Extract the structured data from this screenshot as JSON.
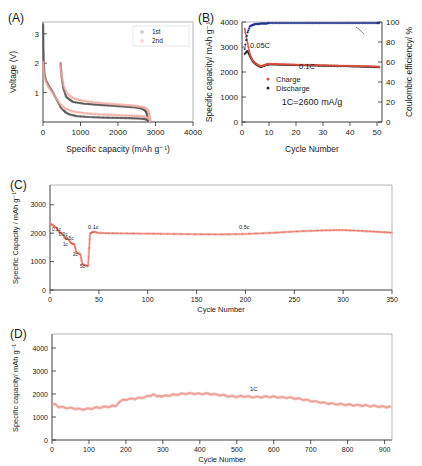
{
  "figure": {
    "panels": [
      "A",
      "B",
      "C",
      "D"
    ],
    "colors": {
      "charge_red": "#d94f3d",
      "discharge_black": "#2b2b2b",
      "efficiency_blue": "#23348c",
      "curve_pink": "#f0a9a0",
      "curve_gray": "#555555",
      "axis": "#2b2b2b"
    }
  },
  "panelA": {
    "label": "(A)",
    "xlabel": "Specific capacity (mAh g⁻¹)",
    "ylabel": "Voltage (V)",
    "xticks": [
      "0",
      "1000",
      "2000",
      "3000",
      "4000"
    ],
    "yticks": [
      "1",
      "2",
      "3"
    ],
    "legend": [
      "1st",
      "2nd"
    ]
  },
  "panelB": {
    "label": "(B)",
    "xlabel": "Cycle Number",
    "ylabel": "Specific capacity/ mAh g⁻¹",
    "ylabel_right": "Coulombic efficiency/ %",
    "xticks": [
      "0",
      "10",
      "20",
      "30",
      "40",
      "50"
    ],
    "yticks": [
      "0",
      "1000",
      "2000",
      "3000",
      "4000"
    ],
    "yticks_right": [
      "0",
      "20",
      "40",
      "60",
      "80",
      "100"
    ],
    "legend": [
      "Charge",
      "Discharge"
    ],
    "annotations": [
      "0.05C",
      "0.1C",
      "1C=2600 mA/g"
    ]
  },
  "panelC": {
    "label": "(C)",
    "xlabel": "Cycle Number",
    "ylabel": "Specific Capacity / mAh g⁻¹",
    "xticks": [
      "0",
      "50",
      "100",
      "150",
      "200",
      "250",
      "300",
      "350"
    ],
    "yticks": [
      "0",
      "1000",
      "2000",
      "3000"
    ],
    "rate_labels": [
      "0.1c",
      "0.2c",
      "0.5c",
      "1c",
      "2c",
      "5c",
      "0.1c",
      "0.5c"
    ]
  },
  "panelD": {
    "label": "(D)",
    "xlabel": "Cycle Number",
    "ylabel": "Specific capacity/ mAh g⁻¹",
    "xticks": [
      "0",
      "100",
      "200",
      "300",
      "400",
      "500",
      "600",
      "700",
      "800",
      "900"
    ],
    "yticks": [
      "0",
      "1000",
      "2000",
      "3000",
      "4000"
    ],
    "annotations": [
      "1C"
    ]
  },
  "chart_data": [
    {
      "type": "line",
      "panel": "A",
      "title": "Galvanostatic charge-discharge voltage profiles",
      "xlabel": "Specific capacity (mAh g-1)",
      "ylabel": "Voltage (V)",
      "xlim": [
        0,
        4000
      ],
      "ylim": [
        0,
        3.4
      ],
      "grid": false,
      "legend": [
        "1st",
        "2nd"
      ],
      "legend_position": "top-right",
      "series": [
        {
          "name": "1st discharge",
          "color": "#555555",
          "x": [
            5,
            10,
            20,
            40,
            80,
            150,
            260,
            380,
            470,
            520,
            560,
            600,
            700,
            900,
            1200,
            1600,
            2000,
            2300,
            2500,
            2650,
            2720,
            2760,
            2790,
            2800
          ],
          "y": [
            3.3,
            2.6,
            2.1,
            1.62,
            1.42,
            1.25,
            1.02,
            0.72,
            0.5,
            0.42,
            0.38,
            0.33,
            0.26,
            0.2,
            0.17,
            0.15,
            0.14,
            0.13,
            0.12,
            0.11,
            0.1,
            0.09,
            0.07,
            0.05
          ]
        },
        {
          "name": "1st charge",
          "color": "#555555",
          "x": [
            2800,
            2780,
            2750,
            2700,
            2600,
            2450,
            2200,
            1900,
            1500,
            1100,
            800,
            620,
            540,
            500,
            480,
            470
          ],
          "y": [
            0.05,
            0.22,
            0.35,
            0.42,
            0.47,
            0.5,
            0.52,
            0.55,
            0.58,
            0.62,
            0.68,
            0.85,
            1.15,
            1.5,
            1.8,
            2.0
          ]
        },
        {
          "name": "2nd discharge",
          "color": "#f0a9a0",
          "x": [
            5,
            12,
            25,
            50,
            100,
            180,
            300,
            450,
            600,
            800,
            1100,
            1500,
            1900,
            2200,
            2450,
            2620,
            2720,
            2790,
            2830,
            2860
          ],
          "y": [
            2.05,
            1.85,
            1.62,
            1.45,
            1.3,
            1.12,
            0.9,
            0.62,
            0.45,
            0.36,
            0.3,
            0.26,
            0.24,
            0.22,
            0.21,
            0.2,
            0.18,
            0.14,
            0.1,
            0.05
          ]
        },
        {
          "name": "2nd charge",
          "color": "#f0a9a0",
          "x": [
            2860,
            2840,
            2810,
            2760,
            2680,
            2550,
            2350,
            2050,
            1700,
            1350,
            1050,
            820,
            660,
            560,
            500,
            470,
            455
          ],
          "y": [
            0.05,
            0.25,
            0.38,
            0.45,
            0.5,
            0.53,
            0.56,
            0.59,
            0.63,
            0.67,
            0.72,
            0.8,
            0.95,
            1.2,
            1.55,
            1.85,
            2.0
          ]
        }
      ]
    },
    {
      "type": "scatter",
      "panel": "B",
      "title": "Cycling performance at 0.05C then 0.1C",
      "xlabel": "Cycle Number",
      "ylabel": "Specific capacity/ mAh g-1",
      "ylabel_right": "Coulombic efficiency/ %",
      "xlim": [
        0,
        52
      ],
      "ylim": [
        0,
        4000
      ],
      "ylim_right": [
        0,
        100
      ],
      "grid": false,
      "legend": [
        "Charge",
        "Discharge"
      ],
      "annotations": [
        {
          "text": "0.05C",
          "x": 4,
          "y": 3250
        },
        {
          "text": "0.1C",
          "x": 24,
          "y": 2620
        },
        {
          "text": "1C=2600 mA/g",
          "x": 26,
          "y": 1200
        }
      ],
      "series": [
        {
          "name": "Discharge",
          "color": "#2b2b2b",
          "axis": "left",
          "x": [
            1,
            2,
            3,
            4,
            5,
            6,
            7,
            8,
            9,
            10,
            12,
            14,
            16,
            18,
            20,
            22,
            24,
            26,
            28,
            30,
            32,
            34,
            36,
            38,
            40,
            42,
            44,
            46,
            48,
            50,
            51
          ],
          "y": [
            2720,
            2850,
            2620,
            2420,
            2320,
            2250,
            2200,
            2240,
            2280,
            2300,
            2300,
            2290,
            2285,
            2280,
            2275,
            2270,
            2265,
            2260,
            2255,
            2250,
            2245,
            2240,
            2235,
            2230,
            2225,
            2220,
            2215,
            2210,
            2205,
            2195,
            2190
          ]
        },
        {
          "name": "Charge",
          "color": "#d94f3d",
          "axis": "left",
          "x": [
            1,
            2,
            3,
            4,
            5,
            6,
            7,
            8,
            9,
            10,
            12,
            14,
            16,
            18,
            20,
            22,
            24,
            26,
            28,
            30,
            32,
            34,
            36,
            38,
            40,
            42,
            44,
            46,
            48,
            50,
            51
          ],
          "y": [
            3720,
            3200,
            2680,
            2460,
            2350,
            2280,
            2230,
            2265,
            2305,
            2325,
            2320,
            2310,
            2305,
            2300,
            2295,
            2290,
            2285,
            2280,
            2275,
            2270,
            2265,
            2260,
            2255,
            2250,
            2245,
            2240,
            2235,
            2230,
            2225,
            2215,
            2210
          ]
        },
        {
          "name": "Coulombic efficiency",
          "color": "#23348c",
          "axis": "right",
          "x": [
            1,
            2,
            3,
            4,
            5,
            6,
            7,
            8,
            9,
            10,
            12,
            14,
            16,
            18,
            20,
            22,
            24,
            26,
            28,
            30,
            32,
            34,
            36,
            38,
            40,
            42,
            44,
            46,
            48,
            50,
            51
          ],
          "y": [
            73,
            89,
            96,
            97,
            98,
            98,
            98.5,
            98.5,
            98.5,
            99,
            99,
            99,
            99,
            99,
            99,
            99,
            99,
            99,
            99,
            99,
            99,
            99,
            99,
            99,
            99,
            99,
            99,
            99,
            99,
            99,
            99
          ]
        }
      ]
    },
    {
      "type": "scatter",
      "panel": "C",
      "title": "Rate capability and long-term cycling",
      "xlabel": "Cycle Number",
      "ylabel": "Specific Capacity / mAh g-1",
      "xlim": [
        0,
        350
      ],
      "ylim": [
        0,
        3700
      ],
      "grid": false,
      "rate_steps": [
        {
          "rate": "0.1c",
          "cycles": [
            1,
            8
          ],
          "capacity": 2330
        },
        {
          "rate": "0.2c",
          "cycles": [
            9,
            14
          ],
          "capacity": 2000
        },
        {
          "rate": "0.5c",
          "cycles": [
            15,
            20
          ],
          "capacity": 1800
        },
        {
          "rate": "1c",
          "cycles": [
            21,
            26
          ],
          "capacity": 1620
        },
        {
          "rate": "2c",
          "cycles": [
            27,
            32
          ],
          "capacity": 1280
        },
        {
          "rate": "5c",
          "cycles": [
            33,
            40
          ],
          "capacity": 880
        },
        {
          "rate": "0.1c",
          "cycles": [
            41,
            45
          ],
          "capacity": 2050
        },
        {
          "rate": "0.5c",
          "cycles": [
            46,
            350
          ],
          "capacity": 2050
        }
      ],
      "series": [
        {
          "name": "Discharge capacity",
          "color": "#d94f3d",
          "x": [
            1,
            3,
            5,
            7,
            9,
            11,
            13,
            15,
            17,
            19,
            21,
            23,
            25,
            27,
            29,
            31,
            33,
            35,
            37,
            39,
            41,
            43,
            45,
            50,
            60,
            75,
            100,
            125,
            150,
            175,
            200,
            225,
            250,
            275,
            290,
            300,
            315,
            330,
            340,
            350
          ],
          "y": [
            2330,
            2280,
            2230,
            2180,
            2050,
            2010,
            1980,
            1840,
            1810,
            1790,
            1660,
            1630,
            1610,
            1330,
            1290,
            1260,
            920,
            880,
            860,
            850,
            1990,
            2030,
            2050,
            2010,
            2000,
            1995,
            1985,
            1975,
            1965,
            1960,
            1975,
            2010,
            2060,
            2095,
            2110,
            2110,
            2090,
            2060,
            2040,
            2020
          ]
        }
      ]
    },
    {
      "type": "scatter",
      "panel": "D",
      "title": "Long-term cycling at 1C over 900 cycles",
      "xlabel": "Cycle Number",
      "ylabel": "Specific capacity/ mAh g-1",
      "xlim": [
        0,
        920
      ],
      "ylim": [
        0,
        4600
      ],
      "grid": false,
      "annotations": [
        {
          "text": "1C",
          "x": 470,
          "y": 2180
        }
      ],
      "series": [
        {
          "name": "Discharge capacity",
          "color": "#eb9d94",
          "x": [
            5,
            20,
            40,
            60,
            80,
            100,
            120,
            140,
            160,
            175,
            185,
            200,
            220,
            240,
            260,
            275,
            290,
            300,
            320,
            340,
            360,
            380,
            400,
            420,
            440,
            460,
            480,
            500,
            520,
            540,
            560,
            580,
            600,
            620,
            640,
            660,
            680,
            700,
            720,
            740,
            760,
            780,
            800,
            820,
            840,
            860,
            880,
            900,
            915
          ],
          "y": [
            1560,
            1430,
            1400,
            1370,
            1330,
            1350,
            1400,
            1430,
            1460,
            1500,
            1700,
            1760,
            1790,
            1820,
            1900,
            1960,
            1890,
            1900,
            1940,
            1980,
            2010,
            2020,
            2000,
            2010,
            1980,
            1950,
            1900,
            1880,
            1900,
            1870,
            1860,
            1880,
            1870,
            1850,
            1840,
            1800,
            1760,
            1700,
            1650,
            1600,
            1570,
            1550,
            1530,
            1510,
            1500,
            1480,
            1460,
            1440,
            1430
          ]
        }
      ]
    }
  ]
}
